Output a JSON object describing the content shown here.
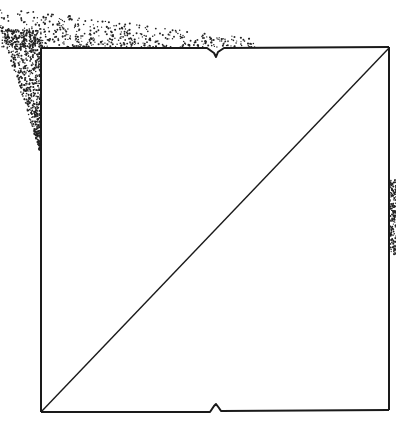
{
  "diagram": {
    "square": {
      "x1": 41,
      "y1": 48,
      "x2": 389,
      "y2": 411
    },
    "diagonal": {
      "from": "bottom-left",
      "to": "top-right"
    },
    "notches": [
      {
        "edge": "top",
        "x": 216,
        "direction": "down"
      },
      {
        "edge": "bottom",
        "x": 216,
        "direction": "up"
      }
    ],
    "stroke_color": "#1a1a1a",
    "stipple_color": "#222222",
    "background": "#ffffff"
  }
}
